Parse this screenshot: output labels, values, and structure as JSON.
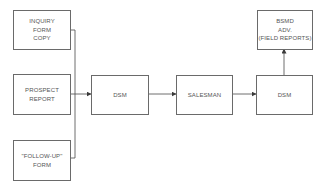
{
  "diagram": {
    "type": "flowchart",
    "nodes": [
      {
        "id": "inquiry_form_copy",
        "lines": [
          "INQUIRY",
          "FORM",
          "COPY"
        ]
      },
      {
        "id": "prospect_report",
        "lines": [
          "PROSPECT",
          "REPORT"
        ]
      },
      {
        "id": "follow_up_form",
        "lines": [
          "\"FOLLOW-UP\"",
          "FORM"
        ]
      },
      {
        "id": "dsm_1",
        "lines": [
          "DSM"
        ]
      },
      {
        "id": "salesman",
        "lines": [
          "SALESMAN"
        ]
      },
      {
        "id": "dsm_2",
        "lines": [
          "DSM"
        ]
      },
      {
        "id": "bsmd_adv",
        "lines": [
          "BSMD",
          "ADV.",
          "(FIELD REPORTS)"
        ]
      }
    ],
    "edges": [
      {
        "from": "inquiry_form_copy",
        "to": "dsm_1"
      },
      {
        "from": "prospect_report",
        "to": "dsm_1"
      },
      {
        "from": "follow_up_form",
        "to": "dsm_1"
      },
      {
        "from": "dsm_1",
        "to": "salesman"
      },
      {
        "from": "salesman",
        "to": "dsm_2"
      },
      {
        "from": "dsm_2",
        "to": "bsmd_adv"
      }
    ],
    "colors": {
      "line": "#4a4a4a",
      "border": "#6a6a6a",
      "text": "#555555",
      "background": "#ffffff"
    }
  }
}
